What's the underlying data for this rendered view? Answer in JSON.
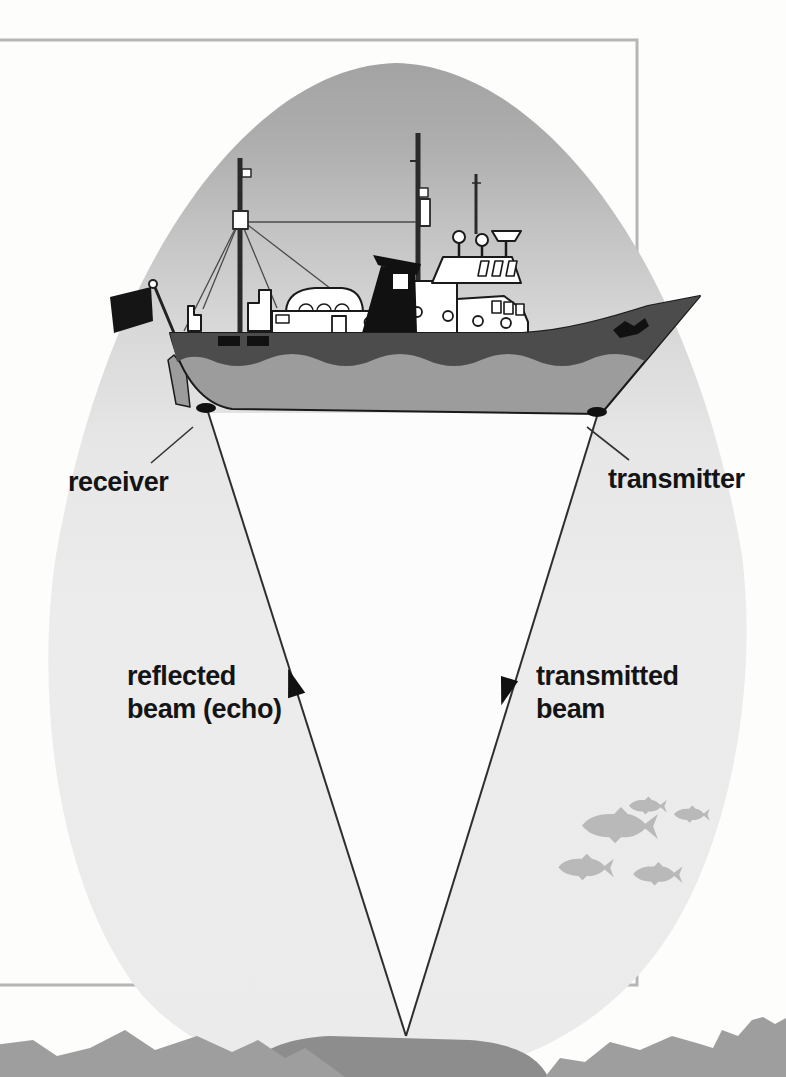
{
  "diagram": {
    "type": "echo-sounding-sonar-diagram",
    "labels": {
      "receiver": "receiver",
      "transmitter": "transmitter",
      "reflected_beam_line1": "reflected",
      "reflected_beam_line2": "beam (echo)",
      "transmitted_beam_line1": "transmitted",
      "transmitted_beam_line2": "beam"
    },
    "illustrations": [
      "fishing-trawler-icon",
      "sonar-cone",
      "reflected-beam-arrow",
      "transmitted-beam-arrow",
      "fish-school-icon",
      "seabed-rocks",
      "seabed-mound"
    ],
    "colors": {
      "background": "#fdfdfc",
      "frame_border": "#b6b6b6",
      "cone_top": "#a3a3a3",
      "cone_bottom": "#ececec",
      "beam_triangle": "#fcfcfc",
      "beam_line": "#2e2e2e",
      "hull_dark_band": "#4c4c4c",
      "hull_lower": "#9c9c9c",
      "ship_black_details": "#111111",
      "superstructure": "#ffffff",
      "fish": "#b9b9b9",
      "rocks": "#9e9e9e",
      "mound": "#8d8d8d",
      "label_text": "#141414"
    }
  }
}
